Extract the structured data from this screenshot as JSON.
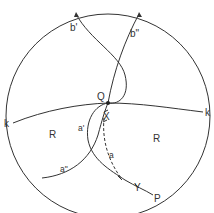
{
  "diagram": {
    "labels": {
      "b_prime": "b'",
      "b_double_prime": "b\"",
      "Q": "Q",
      "X": "X",
      "Y": "Y",
      "P": "P",
      "k_left": "k",
      "k_right": "k",
      "R_left": "R",
      "R_right": "R",
      "a": "a",
      "a_prime": "a'",
      "a_double_prime": "a\""
    },
    "colors": {
      "stroke": "#333333",
      "background": "#ffffff"
    }
  }
}
